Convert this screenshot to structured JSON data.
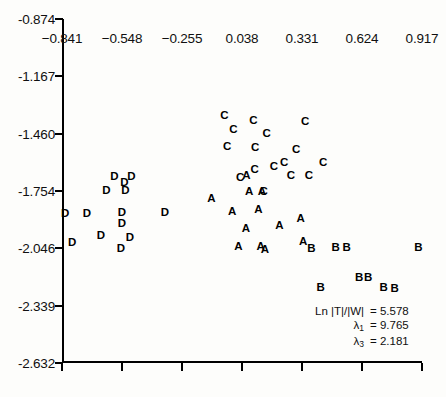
{
  "chart_data": {
    "type": "scatter",
    "title": "",
    "xlabel": "",
    "ylabel": "",
    "xlim": [
      -0.841,
      0.917
    ],
    "ylim": [
      -2.632,
      -0.874
    ],
    "grid": false,
    "legend_position": "none",
    "xticks": [
      -0.841,
      -0.548,
      -0.255,
      0.038,
      0.331,
      0.624,
      0.917
    ],
    "xtick_labels": [
      "−0.841",
      "−0.548",
      "−0.255",
      "0.038",
      "0.331",
      "0.624",
      "0.917"
    ],
    "yticks": [
      -0.874,
      -1.167,
      -1.46,
      -1.754,
      -2.046,
      -2.339,
      -2.632
    ],
    "ytick_labels": [
      "-0.874",
      "-1.167",
      "-1.460",
      "-1.754",
      "-2.046",
      "-2.339",
      "-2.632"
    ],
    "marker_style": "group letter label",
    "groups": [
      "A",
      "B",
      "C",
      "D"
    ],
    "series": [
      {
        "name": "A",
        "label": "A",
        "points": [
          [
            -0.112,
            -1.795
          ],
          [
            -0.01,
            -1.859
          ],
          [
            0.057,
            -1.947
          ],
          [
            0.073,
            -1.757
          ],
          [
            0.118,
            -1.85
          ],
          [
            0.135,
            -1.757
          ],
          [
            0.02,
            -2.04
          ],
          [
            0.129,
            -2.04
          ],
          [
            0.221,
            -1.93
          ],
          [
            0.15,
            -2.055
          ],
          [
            0.325,
            -1.896
          ],
          [
            0.337,
            -2.016
          ],
          [
            0.06,
            -1.677
          ]
        ]
      },
      {
        "name": "B",
        "label": "B",
        "points": [
          [
            0.377,
            -2.049
          ],
          [
            0.495,
            -2.044
          ],
          [
            0.549,
            -2.044
          ],
          [
            0.9,
            -2.044
          ],
          [
            0.61,
            -2.197
          ],
          [
            0.654,
            -2.197
          ],
          [
            0.783,
            -2.255
          ],
          [
            0.422,
            -2.25
          ],
          [
            0.73,
            -2.25
          ]
        ]
      },
      {
        "name": "C",
        "label": "C",
        "points": [
          [
            -0.048,
            -1.37
          ],
          [
            0.094,
            -1.395
          ],
          [
            -0.004,
            -1.44
          ],
          [
            0.158,
            -1.46
          ],
          [
            -0.035,
            -1.528
          ],
          [
            0.102,
            -1.533
          ],
          [
            0.346,
            -1.4
          ],
          [
            0.302,
            -1.543
          ],
          [
            0.434,
            -1.612
          ],
          [
            0.277,
            -1.676
          ],
          [
            0.365,
            -1.676
          ],
          [
            0.244,
            -1.612
          ],
          [
            0.194,
            -1.632
          ],
          [
            0.1,
            -1.646
          ],
          [
            0.029,
            -1.685
          ],
          [
            0.144,
            -1.76
          ]
        ]
      },
      {
        "name": "D",
        "label": "D",
        "points": [
          [
            -0.585,
            -1.68
          ],
          [
            -0.536,
            -1.71
          ],
          [
            -0.502,
            -1.68
          ],
          [
            -0.624,
            -1.755
          ],
          [
            -0.531,
            -1.755
          ],
          [
            -0.826,
            -1.868
          ],
          [
            -0.719,
            -1.868
          ],
          [
            -0.548,
            -1.863
          ],
          [
            -0.338,
            -1.863
          ],
          [
            -0.548,
            -1.922
          ],
          [
            -0.792,
            -2.02
          ],
          [
            -0.651,
            -1.981
          ],
          [
            -0.509,
            -1.991
          ],
          [
            -0.553,
            -2.049
          ]
        ]
      }
    ],
    "annotations": [
      {
        "lhs": "Ln |T|/|W|",
        "rhs": "= 5.578",
        "value": 5.578,
        "symbol": "Ln |T|/|W|"
      },
      {
        "lhs": "λ",
        "lhs_sub": "1",
        "rhs": "= 9.765",
        "value": 9.765,
        "symbol": "lambda_1"
      },
      {
        "lhs": "λ",
        "lhs_sub": "3",
        "rhs": "= 2.181",
        "value": 2.181,
        "symbol": "lambda_3"
      }
    ]
  }
}
